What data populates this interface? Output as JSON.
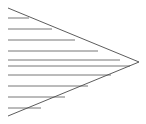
{
  "figure": {
    "canvas": {
      "width": 146,
      "height": 124,
      "background_color": "#ffffff"
    },
    "colors": {
      "stroke": "#666666",
      "stroke_dark": "#4a4a4a",
      "background": "#ffffff"
    },
    "stroke_width": 0.9,
    "apex": {
      "x": 139,
      "y": 62
    },
    "wedge": {
      "top_start": {
        "x": 8,
        "y": 8
      },
      "bottom_start": {
        "x": 8,
        "y": 116
      },
      "description": "two straight edges converging from the left edge to a point at the right"
    },
    "horizontal_lines": [
      {
        "index": 1,
        "y": 18,
        "x_start": 8,
        "x_end": 29
      },
      {
        "index": 2,
        "y": 29,
        "x_start": 8,
        "x_end": 52
      },
      {
        "index": 3,
        "y": 40,
        "x_start": 8,
        "x_end": 75
      },
      {
        "index": 4,
        "y": 51,
        "x_start": 8,
        "x_end": 98
      },
      {
        "index": 5,
        "y": 60,
        "x_start": 8,
        "x_end": 120
      },
      {
        "index": 6,
        "y": 66,
        "x_start": 8,
        "x_end": 130
      },
      {
        "index": 7,
        "y": 75,
        "x_start": 8,
        "x_end": 111
      },
      {
        "index": 8,
        "y": 86,
        "x_start": 8,
        "x_end": 88
      },
      {
        "index": 9,
        "y": 97,
        "x_start": 8,
        "x_end": 65
      },
      {
        "index": 10,
        "y": 108,
        "x_start": 8,
        "x_end": 41
      }
    ],
    "line_count": 10
  }
}
